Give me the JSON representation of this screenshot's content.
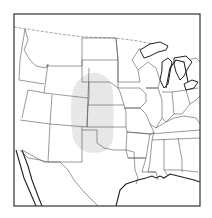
{
  "map": {
    "title": "",
    "extent": "Central and Western United States",
    "highlighted_region": {
      "label": "Southern Great Plains",
      "states_covered": [
        "Colorado (east)",
        "Nebraska",
        "Kansas",
        "Oklahoma",
        "Texas (panhandle)",
        "South Dakota (south)"
      ],
      "pattern": "stippled",
      "color": "#999999"
    },
    "colors": {
      "border": "#333333",
      "state_lines": "#555555",
      "background": "#ffffff"
    }
  }
}
